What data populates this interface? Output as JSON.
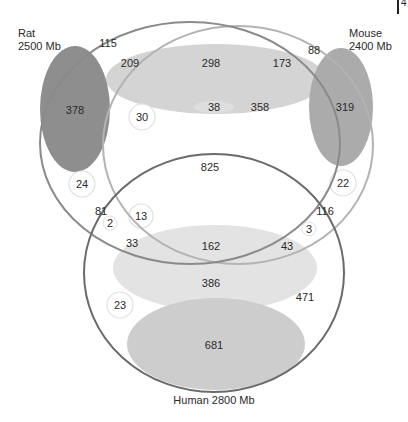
{
  "diagram": {
    "type": "venn",
    "sets": [
      {
        "name": "Rat",
        "size_label": "2500 Mb",
        "stroke": "#8a8a8a"
      },
      {
        "name": "Mouse",
        "size_label": "2400 Mb",
        "stroke": "#b5b5b5"
      },
      {
        "name": "Human",
        "size_label": "2800 Mb",
        "stroke": "#6a6a6a"
      }
    ],
    "labels": {
      "rat_name": "Rat",
      "rat_size": "2500 Mb",
      "mouse_name": "Mouse",
      "mouse_size": "2400 Mb",
      "human": "Human  2800 Mb"
    },
    "corner_fragment": "4",
    "colors": {
      "dark_fill": "#8c8c8c",
      "mid_fill": "#b8b8b8",
      "light_fill": "#d6d6d6",
      "pale_fill": "#e6e6e6",
      "bubble_stroke": "#e2e2e2"
    },
    "regions": {
      "rat_only_outer": "115",
      "rat_dark_ellipse": "378",
      "rat_mouse_top_left": "209",
      "rat_mouse_top_center": "298",
      "rat_mouse_top_right": "173",
      "mouse_only_outer": "88",
      "mouse_dark_ellipse": "319",
      "small_pale_ellipse": "38",
      "rat_mouse_mid": "358",
      "bubble_30": "30",
      "bubble_24": "24",
      "bubble_22": "22",
      "all_three_center": "825",
      "rat_human_81": "81",
      "bubble_2": "2",
      "bubble_13": "13",
      "mouse_human_116": "116",
      "bubble_3": "3",
      "crossing_33": "33",
      "crossing_43": "43",
      "human_band_162": "162",
      "human_band_386": "386",
      "bubble_23": "23",
      "human_only_471": "471",
      "human_ellipse_681": "681"
    }
  }
}
